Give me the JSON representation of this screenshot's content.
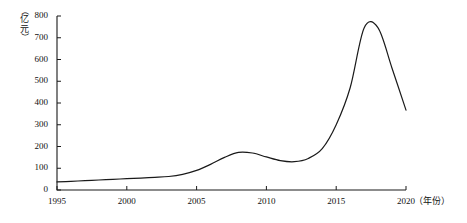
{
  "chart_data": {
    "type": "line",
    "title": "",
    "xlabel": "（年份）",
    "ylabel": "（亿元）",
    "ylabel_chars": [
      "（",
      "亿",
      "元",
      "）"
    ],
    "xlim": [
      1995,
      2020
    ],
    "ylim": [
      0,
      800
    ],
    "grid": false,
    "legend": null,
    "y_ticks": [
      0,
      100,
      200,
      300,
      400,
      500,
      600,
      700,
      800
    ],
    "y_tick_labels": [
      "0",
      "100",
      "200",
      "300",
      "400",
      "500",
      "600",
      "700",
      "800"
    ],
    "x_ticks": [
      1995,
      2000,
      2005,
      2010,
      2015,
      2020
    ],
    "x_tick_labels": [
      "1995",
      "2000",
      "2005",
      "2010",
      "2015",
      "2020"
    ],
    "x_axis_end_label": "2020（年份）",
    "line_color": "#1a1a1a",
    "line_width": 1.2,
    "x": [
      1995,
      1996,
      1997,
      1998,
      1999,
      2000,
      2001,
      2002,
      2003,
      2004,
      2005,
      2006,
      2007,
      2008,
      2009,
      2010,
      2011,
      2012,
      2013,
      2014,
      2015,
      2016,
      2017,
      2018,
      2019,
      2020
    ],
    "values": [
      37,
      40,
      43,
      46,
      49,
      52,
      55,
      58,
      62,
      72,
      90,
      118,
      150,
      173,
      170,
      152,
      135,
      130,
      145,
      190,
      300,
      470,
      745,
      745,
      560,
      367
    ]
  },
  "axis": {
    "y_title_text": "（亿元）",
    "x_title_text": "（年份）"
  }
}
